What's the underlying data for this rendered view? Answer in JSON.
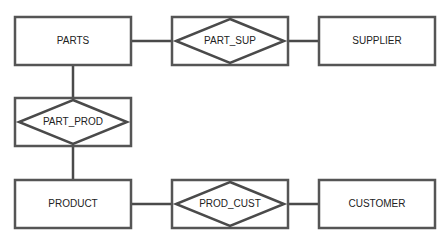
{
  "diagram": {
    "type": "entity-relationship",
    "entities": [
      {
        "id": "parts",
        "label": "PARTS"
      },
      {
        "id": "supplier",
        "label": "SUPPLIER"
      },
      {
        "id": "product",
        "label": "PRODUCT"
      },
      {
        "id": "customer",
        "label": "CUSTOMER"
      }
    ],
    "relationships": [
      {
        "id": "part_sup",
        "label": "PART_SUP",
        "connects": [
          "parts",
          "supplier"
        ]
      },
      {
        "id": "part_prod",
        "label": "PART_PROD",
        "connects": [
          "parts",
          "product"
        ]
      },
      {
        "id": "prod_cust",
        "label": "PROD_CUST",
        "connects": [
          "product",
          "customer"
        ]
      }
    ]
  }
}
